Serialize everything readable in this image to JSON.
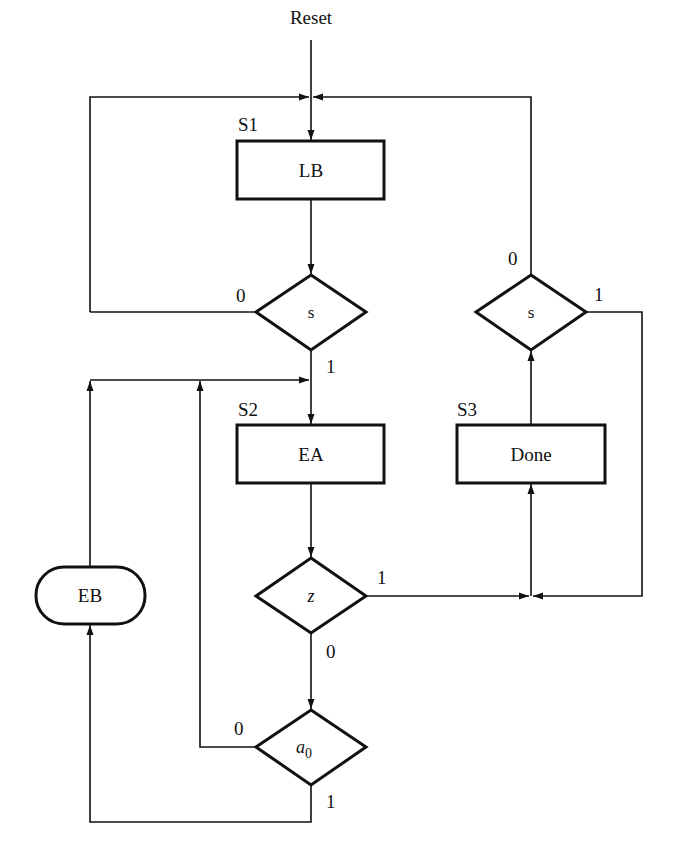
{
  "diagram": {
    "type": "ASM chart",
    "reset_label": "Reset",
    "states": [
      {
        "name": "S1",
        "output": "LB"
      },
      {
        "name": "S2",
        "output": "EA"
      },
      {
        "name": "S3",
        "output": "Done"
      }
    ],
    "conditional_outputs": [
      {
        "label": "EB"
      }
    ],
    "decisions": [
      {
        "id": "s_s1",
        "condition": "s",
        "branch_0": "0",
        "branch_1": "1"
      },
      {
        "id": "z_s2",
        "condition": "z",
        "branch_0": "0",
        "branch_1": "1"
      },
      {
        "id": "a0_s2",
        "condition_base": "a",
        "condition_sub": "0",
        "branch_0": "0",
        "branch_1": "1"
      },
      {
        "id": "s_s3",
        "condition": "s",
        "branch_0": "0",
        "branch_1": "1"
      }
    ]
  },
  "colors": {
    "stroke": "#111111",
    "background": "#ffffff"
  }
}
